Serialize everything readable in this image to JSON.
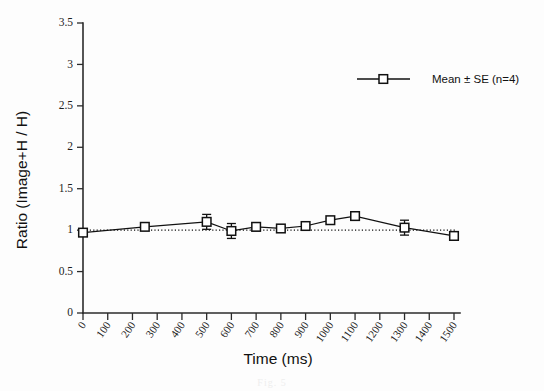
{
  "figure": {
    "background_color": "#fdfdfd",
    "line_color": "#111111",
    "marker_fill": "#ffffff",
    "caption_faint": "Fig. 5"
  },
  "chart_data": {
    "type": "line",
    "title": "",
    "subtitle": "",
    "xlabel": "Time (ms)",
    "ylabel": "Ratio (Image+H / H)",
    "xlim": [
      0,
      1500
    ],
    "ylim": [
      0,
      3.5
    ],
    "grid": false,
    "legend_position": "top-right",
    "x": [
      0,
      250,
      500,
      600,
      700,
      800,
      900,
      1000,
      1100,
      1300,
      1500
    ],
    "series": [
      {
        "name": "Mean ± SE (n=4)",
        "marker": "open-square",
        "values": [
          0.97,
          1.04,
          1.1,
          0.99,
          1.04,
          1.02,
          1.05,
          1.12,
          1.17,
          1.03,
          0.93
        ],
        "errors": [
          0.02,
          0.02,
          0.09,
          0.09,
          0.05,
          0.02,
          0.02,
          0.02,
          0.02,
          0.09,
          0.04
        ]
      }
    ],
    "reference_line": {
      "name": "unity-reference",
      "style": "dotted",
      "y": 1.0
    },
    "xticks": [
      0,
      100,
      200,
      300,
      400,
      500,
      600,
      700,
      800,
      900,
      1000,
      1100,
      1200,
      1300,
      1400,
      1500
    ],
    "xtick_labels": [
      "0",
      "100",
      "200",
      "300",
      "400",
      "500",
      "600",
      "700",
      "800",
      "900",
      "1000",
      "1100",
      "1200",
      "1300",
      "1400",
      "1500"
    ],
    "yticks": [
      0,
      0.5,
      1,
      1.5,
      2,
      2.5,
      3,
      3.5
    ],
    "ytick_labels": [
      "0",
      "0.5",
      "1",
      "1.5",
      "2",
      "2.5",
      "3",
      "3.5"
    ]
  },
  "legend": {
    "entries": [
      {
        "label": "Mean ± SE (n=4)",
        "marker": "open-square"
      }
    ]
  }
}
